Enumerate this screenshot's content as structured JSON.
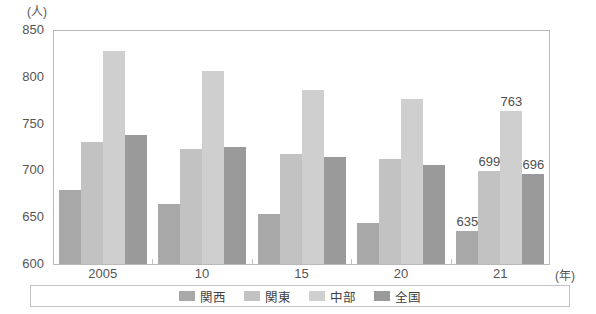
{
  "chart_data": {
    "type": "bar",
    "title": "",
    "subtitle": "",
    "xlabel": "(年)",
    "ylabel": "(人)",
    "unit_label": "(人)",
    "year_unit_label": "(年)",
    "categories": [
      "2005",
      "10",
      "15",
      "20",
      "21"
    ],
    "ylim": [
      600,
      850
    ],
    "yticks": [
      600,
      650,
      700,
      750,
      800,
      850
    ],
    "ytick_labels": [
      "600",
      "650",
      "700",
      "750",
      "800",
      "850"
    ],
    "grid": false,
    "legend_position": "bottom",
    "series": [
      {
        "name": "関西",
        "color": "#a8a8a8",
        "values": [
          679,
          664,
          653,
          644,
          635
        ]
      },
      {
        "name": "関東",
        "color": "#c2c2c2",
        "values": [
          730,
          723,
          718,
          712,
          699
        ]
      },
      {
        "name": "中部",
        "color": "#cfcfcf",
        "values": [
          828,
          806,
          786,
          776,
          763
        ]
      },
      {
        "name": "全国",
        "color": "#9a9a9a",
        "values": [
          738,
          725,
          714,
          706,
          696
        ]
      }
    ],
    "annotations": [
      {
        "text": "635",
        "series": "関西",
        "category": "21",
        "value": 635
      },
      {
        "text": "699",
        "series": "関東",
        "category": "21",
        "value": 699
      },
      {
        "text": "763",
        "series": "中部",
        "category": "21",
        "value": 763
      },
      {
        "text": "696",
        "series": "全国",
        "category": "21",
        "value": 696
      }
    ]
  },
  "legend": {
    "items": [
      {
        "label": "関西",
        "color": "#a8a8a8"
      },
      {
        "label": "関東",
        "color": "#c2c2c2"
      },
      {
        "label": "中部",
        "color": "#cfcfcf"
      },
      {
        "label": "全国",
        "color": "#9a9a9a"
      }
    ]
  },
  "axis": {
    "y_unit": "(人)",
    "x_unit": "(年)",
    "y_labels": [
      "850",
      "800",
      "750",
      "700",
      "650",
      "600"
    ],
    "x_labels": [
      "2005",
      "10",
      "15",
      "20",
      "21"
    ]
  }
}
